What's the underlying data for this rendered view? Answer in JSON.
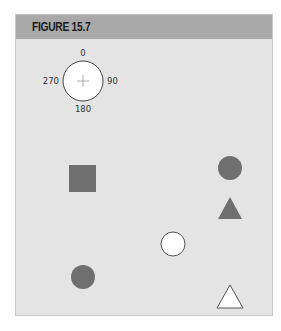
{
  "figure": {
    "title": "FIGURE 15.7"
  },
  "compass": {
    "labels": {
      "top": "0",
      "right": "90",
      "bottom": "180",
      "left": "270"
    },
    "center": [
      83,
      81
    ],
    "radius": 20
  },
  "shapes": [
    {
      "type": "square",
      "fill": "#6f6f6f",
      "x": 69,
      "y": 165,
      "size": 27
    },
    {
      "type": "circle",
      "fill": "#6f6f6f",
      "cx": 230,
      "cy": 168,
      "r": 12
    },
    {
      "type": "triangle",
      "fill": "#6f6f6f",
      "points": "230,197 242,219 218,219"
    },
    {
      "type": "circle",
      "fill": "#ffffff",
      "stroke": "#555555",
      "cx": 173,
      "cy": 244,
      "r": 12
    },
    {
      "type": "circle",
      "fill": "#6f6f6f",
      "cx": 83,
      "cy": 277,
      "r": 12
    },
    {
      "type": "triangle",
      "fill": "#ffffff",
      "stroke": "#555555",
      "points": "230,285 243,308 217,308"
    }
  ],
  "colors": {
    "panel": "#e4e4e4",
    "header": "#a9a9a9",
    "shape_dark": "#6f6f6f"
  }
}
